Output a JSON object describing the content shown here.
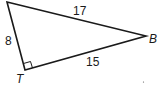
{
  "diagram": {
    "type": "right-triangle",
    "vertices": {
      "top": {
        "label": "",
        "x": 7,
        "y": 2
      },
      "B": {
        "label": "B",
        "x": 146,
        "y": 36
      },
      "T": {
        "label": "T",
        "x": 25,
        "y": 70
      }
    },
    "sides": {
      "hypotenuse": {
        "label": "17",
        "from": "top",
        "to": "B"
      },
      "left_leg": {
        "label": "8",
        "from": "top",
        "to": "T"
      },
      "bottom_leg": {
        "label": "15",
        "from": "T",
        "to": "B"
      }
    },
    "right_angle_at": "T",
    "stroke_color": "#1a1a1a"
  }
}
